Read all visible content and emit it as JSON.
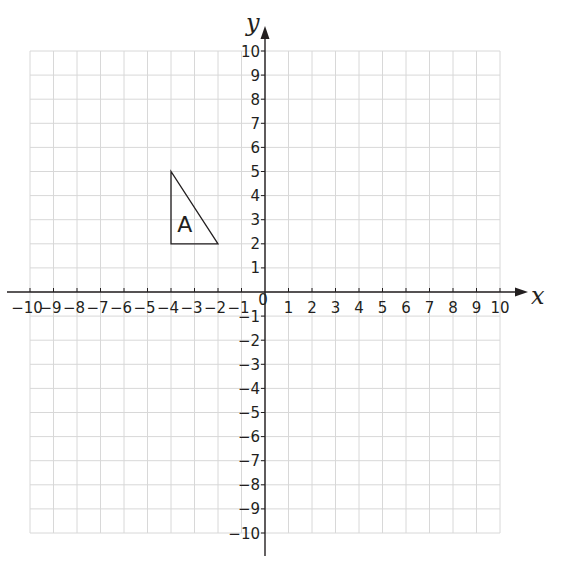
{
  "diagram": {
    "type": "coordinate-grid",
    "x_axis": {
      "label": "x",
      "min": -10,
      "max": 10,
      "ticks": [
        -10,
        -9,
        -8,
        -7,
        -6,
        -5,
        -4,
        -3,
        -2,
        -1,
        1,
        2,
        3,
        4,
        5,
        6,
        7,
        8,
        9,
        10
      ]
    },
    "y_axis": {
      "label": "y",
      "min": -10,
      "max": 10,
      "ticks": [
        10,
        9,
        8,
        7,
        6,
        5,
        4,
        3,
        2,
        1,
        -1,
        -2,
        -3,
        -4,
        -5,
        -6,
        -7,
        -8,
        -9,
        -10
      ]
    },
    "origin_label": "0",
    "shapes": [
      {
        "name": "A",
        "label": "A",
        "type": "triangle",
        "vertices": [
          [
            -4,
            5
          ],
          [
            -4,
            2
          ],
          [
            -2,
            2
          ]
        ]
      }
    ],
    "colors": {
      "grid": "#d8d8d8",
      "axis": "#231f20",
      "shape": "#231f20",
      "background": "#ffffff"
    }
  }
}
